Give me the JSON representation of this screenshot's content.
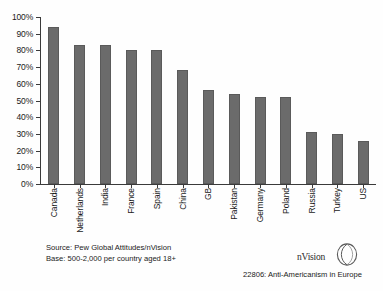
{
  "chart_data": {
    "type": "bar",
    "title": "",
    "xlabel": "",
    "ylabel": "",
    "ylim": [
      0,
      100
    ],
    "grid": false,
    "legend": "none",
    "orientation": "vertical",
    "bar_color": "#6b6b6b",
    "y_tick_labels": [
      "100%",
      "90%",
      "80%",
      "70%",
      "60%",
      "50%",
      "40%",
      "30%",
      "20%",
      "10%",
      "0%"
    ],
    "y_ticks": [
      100,
      90,
      80,
      70,
      60,
      50,
      40,
      30,
      20,
      10,
      0
    ],
    "categories": [
      "Canada",
      "Netherlands",
      "India",
      "France",
      "Spain",
      "China",
      "GB",
      "Pakistan",
      "Germany",
      "Poland",
      "Russia",
      "Turkey",
      "US"
    ],
    "values": [
      94,
      83,
      83,
      80,
      80,
      68,
      56,
      54,
      52,
      52,
      31,
      30,
      26
    ]
  },
  "source": {
    "line1": "Source: Pew Global Attitudes/nVision",
    "line2": "Base: 500-2,000 per country aged 18+"
  },
  "logo": {
    "text": "nVision",
    "mark": "leaf-circle-mark"
  },
  "caption": {
    "text": "22806: Anti-Americanism in Europe"
  }
}
